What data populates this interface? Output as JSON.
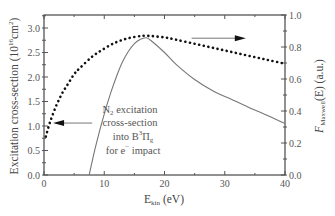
{
  "chart_data": {
    "type": "line",
    "title": "",
    "xlabel": "E_kin (eV)",
    "xlabel_main": "E",
    "xlabel_sub": "kin",
    "xlabel_unit": " (eV)",
    "ylabel_left": "Excitation cross-section (10^-16 cm^2)",
    "ylabel_left_main": "Excitation cross-section (10",
    "ylabel_left_sup": "16",
    "ylabel_left_unit": "cm",
    "ylabel_left_sup2": "2",
    "ylabel_right": "F_Maxwell(E) (a.u.)",
    "ylabel_right_main": "F",
    "ylabel_right_sub": "Maxwell",
    "ylabel_right_rest": "(E) (a.u.)",
    "xlim": [
      0,
      40
    ],
    "ylim_left": [
      0,
      3.25
    ],
    "ylim_right": [
      0,
      1.0
    ],
    "x_ticks": [
      "0",
      "10",
      "20",
      "30",
      "40"
    ],
    "y_left_ticks": [
      "0.0",
      "0.5",
      "1.0",
      "1.5",
      "2.0",
      "2.5",
      "3.0"
    ],
    "y_right_ticks": [
      "0.0",
      "0.2",
      "0.4",
      "0.6",
      "0.8",
      "1.0"
    ],
    "grid": false,
    "legend": "none",
    "annotation": {
      "line1": "N",
      "line1_sub": "2",
      "line1_rest": " excitation",
      "line2": "cross-section",
      "line3": "into B",
      "line3_sup": "3",
      "line3_rest": "Π",
      "line3_sub": "g",
      "line4": "for e",
      "line4_sup": "−",
      "line4_rest": " impact"
    },
    "series": [
      {
        "name": "N2 excitation cross-section into B3Πg for e− impact",
        "axis": "left",
        "style": "solid",
        "x": [
          7.5,
          8.5,
          10,
          11,
          12,
          13,
          14,
          15,
          16,
          17,
          18,
          20,
          22,
          25,
          28,
          31,
          34,
          37,
          40
        ],
        "y": [
          0.0,
          0.55,
          1.25,
          1.65,
          2.0,
          2.3,
          2.52,
          2.68,
          2.77,
          2.8,
          2.72,
          2.5,
          2.25,
          1.95,
          1.72,
          1.55,
          1.38,
          1.22,
          1.05
        ]
      },
      {
        "name": "Maxwell distribution F_Maxwell(E)",
        "axis": "right",
        "style": "dotted",
        "x": [
          0.3,
          1,
          2,
          3,
          4,
          5,
          6,
          8,
          10,
          12,
          14,
          16,
          17,
          18,
          20,
          22,
          25,
          28,
          31,
          34,
          37,
          40
        ],
        "y": [
          0.24,
          0.33,
          0.43,
          0.51,
          0.57,
          0.63,
          0.67,
          0.74,
          0.79,
          0.83,
          0.855,
          0.868,
          0.87,
          0.868,
          0.86,
          0.845,
          0.82,
          0.795,
          0.77,
          0.745,
          0.72,
          0.695
        ]
      }
    ],
    "arrows": [
      {
        "points_to": "left",
        "from_x": 8.0,
        "to_x": 1.5,
        "y_left": 1.06
      },
      {
        "points_to": "right",
        "from_x": 24.5,
        "to_x": 33.5,
        "y_right": 0.855
      }
    ]
  }
}
